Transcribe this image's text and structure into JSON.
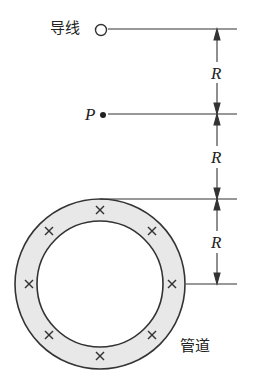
{
  "diagram": {
    "wire_label": "导线",
    "point_label": "P",
    "pipe_label": "管道",
    "dimension_labels": [
      "R",
      "R",
      "R"
    ],
    "current_symbol": "×",
    "current_markers_count": 8,
    "colors": {
      "line": "#333333",
      "pipe_fill": "#e6e6e6",
      "background": "#ffffff"
    }
  }
}
